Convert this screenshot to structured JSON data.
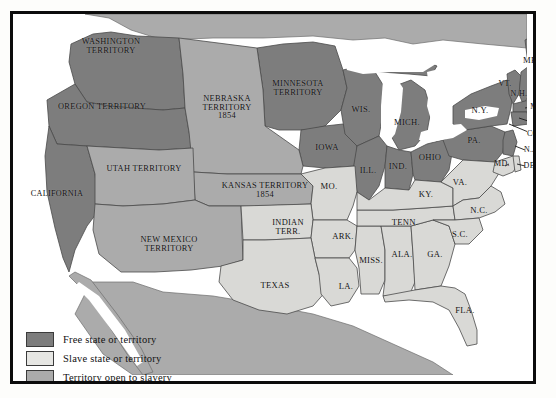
{
  "map": {
    "title": "United States 1854 — Free and Slave States and Territories",
    "colors": {
      "free": "#7d7d7d",
      "slave": "#d9d9d6",
      "open": "#ababab",
      "water": "#ffffff",
      "foreign": "#ababab",
      "outline": "#4a4a4a",
      "frame": "#0c0c0c",
      "page_background": "#fdfdfb",
      "text": "#111111"
    }
  },
  "legend": {
    "items": [
      {
        "swatch": "#7d7d7d",
        "label": "Free state or territory"
      },
      {
        "swatch": "#e6e6e3",
        "label": "Slave state or territory"
      },
      {
        "swatch": "#ababab",
        "label": "Territory open to slavery"
      }
    ]
  },
  "regions": [
    {
      "name": "washington-territory",
      "label": "WASHINGTON\nTERRITORY",
      "status": "free",
      "x": 98,
      "y": 33,
      "size": 8.4
    },
    {
      "name": "oregon-territory",
      "label": "OREGON TERRITORY",
      "status": "free",
      "x": 89,
      "y": 93,
      "size": 8.4
    },
    {
      "name": "california",
      "label": "CALIFORNIA",
      "status": "free",
      "x": 44,
      "y": 180,
      "size": 8.2
    },
    {
      "name": "utah-territory",
      "label": "UTAH TERRITORY",
      "status": "open",
      "x": 131,
      "y": 155,
      "size": 8.4
    },
    {
      "name": "new-mexico-territory",
      "label": "NEW MEXICO\nTERRITORY",
      "status": "open",
      "x": 156,
      "y": 231,
      "size": 8.4
    },
    {
      "name": "nebraska-territory",
      "label": "NEBRASKA\nTERRITORY\n1854",
      "status": "open",
      "x": 214,
      "y": 94,
      "size": 8.4
    },
    {
      "name": "kansas-territory",
      "label": "KANSAS TERRITORY\n1854",
      "status": "open",
      "x": 252,
      "y": 177,
      "size": 8.4
    },
    {
      "name": "minnesota-territory",
      "label": "MINNESOTA\nTERRITORY",
      "status": "free",
      "x": 285,
      "y": 75,
      "size": 8.4
    },
    {
      "name": "iowa",
      "label": "IOWA",
      "status": "free",
      "x": 314,
      "y": 133,
      "size": 8.6
    },
    {
      "name": "wisconsin",
      "label": "WIS.",
      "status": "free",
      "x": 348,
      "y": 95,
      "size": 8.6
    },
    {
      "name": "michigan",
      "label": "MICH.",
      "status": "free",
      "x": 394,
      "y": 108,
      "size": 8.6
    },
    {
      "name": "illinois",
      "label": "ILL.",
      "status": "free",
      "x": 355,
      "y": 156,
      "size": 8.6
    },
    {
      "name": "indiana",
      "label": "IND.",
      "status": "free",
      "x": 385,
      "y": 152,
      "size": 8.6
    },
    {
      "name": "ohio",
      "label": "OHIO",
      "status": "free",
      "x": 417,
      "y": 143,
      "size": 8.6
    },
    {
      "name": "pennsylvania",
      "label": "PA.",
      "status": "free",
      "x": 461,
      "y": 126,
      "size": 8.6
    },
    {
      "name": "new-york",
      "label": "N.Y.",
      "status": "free",
      "x": 467,
      "y": 96,
      "size": 8.6
    },
    {
      "name": "maine",
      "label": "ME.",
      "status": "free",
      "x": 518,
      "y": 46,
      "size": 8.6
    },
    {
      "name": "vermont",
      "label": "VT.",
      "status": "free",
      "x": 492,
      "y": 70,
      "size": 8.0
    },
    {
      "name": "new-hampshire",
      "label": "N.H.",
      "status": "free",
      "x": 506,
      "y": 80,
      "size": 8.0
    },
    {
      "name": "massachusetts",
      "label": "MASS.",
      "status": "free",
      "x": 530,
      "y": 93,
      "size": 8.0
    },
    {
      "name": "rhode-island",
      "label": "R.I.",
      "status": "free",
      "x": 527,
      "y": 108,
      "size": 8.0
    },
    {
      "name": "connecticut",
      "label": "CONN.",
      "status": "free",
      "x": 527,
      "y": 120,
      "size": 8.0
    },
    {
      "name": "new-jersey",
      "label": "N.J.",
      "status": "free",
      "x": 518,
      "y": 136,
      "size": 8.0
    },
    {
      "name": "maryland",
      "label": "MD.",
      "status": "slave",
      "x": 489,
      "y": 150,
      "size": 8.0
    },
    {
      "name": "delaware",
      "label": "DEL.",
      "status": "slave",
      "x": 520,
      "y": 152,
      "size": 8.0
    },
    {
      "name": "virginia",
      "label": "VA.",
      "status": "slave",
      "x": 447,
      "y": 168,
      "size": 8.6
    },
    {
      "name": "north-carolina",
      "label": "N.C.",
      "status": "slave",
      "x": 466,
      "y": 196,
      "size": 8.6
    },
    {
      "name": "south-carolina",
      "label": "S.C.",
      "status": "slave",
      "x": 447,
      "y": 220,
      "size": 8.6
    },
    {
      "name": "georgia",
      "label": "GA.",
      "status": "slave",
      "x": 422,
      "y": 240,
      "size": 8.6
    },
    {
      "name": "florida",
      "label": "FLA.",
      "status": "slave",
      "x": 452,
      "y": 296,
      "size": 8.6
    },
    {
      "name": "alabama",
      "label": "ALA.",
      "status": "slave",
      "x": 389,
      "y": 240,
      "size": 8.6
    },
    {
      "name": "mississippi",
      "label": "MISS.",
      "status": "slave",
      "x": 358,
      "y": 246,
      "size": 8.6
    },
    {
      "name": "tennessee",
      "label": "TENN.",
      "status": "slave",
      "x": 392,
      "y": 208,
      "size": 8.6
    },
    {
      "name": "kentucky",
      "label": "KY.",
      "status": "slave",
      "x": 413,
      "y": 180,
      "size": 8.6
    },
    {
      "name": "arkansas",
      "label": "ARK.",
      "status": "slave",
      "x": 330,
      "y": 222,
      "size": 8.6
    },
    {
      "name": "louisiana",
      "label": "LA.",
      "status": "slave",
      "x": 333,
      "y": 272,
      "size": 8.6
    },
    {
      "name": "missouri",
      "label": "MO.",
      "status": "slave",
      "x": 316,
      "y": 172,
      "size": 8.6
    },
    {
      "name": "indian-territory",
      "label": "INDIAN\nTERR.",
      "status": "slave",
      "x": 275,
      "y": 214,
      "size": 8.4
    },
    {
      "name": "texas",
      "label": "TEXAS",
      "status": "slave",
      "x": 262,
      "y": 271,
      "size": 8.6
    }
  ]
}
